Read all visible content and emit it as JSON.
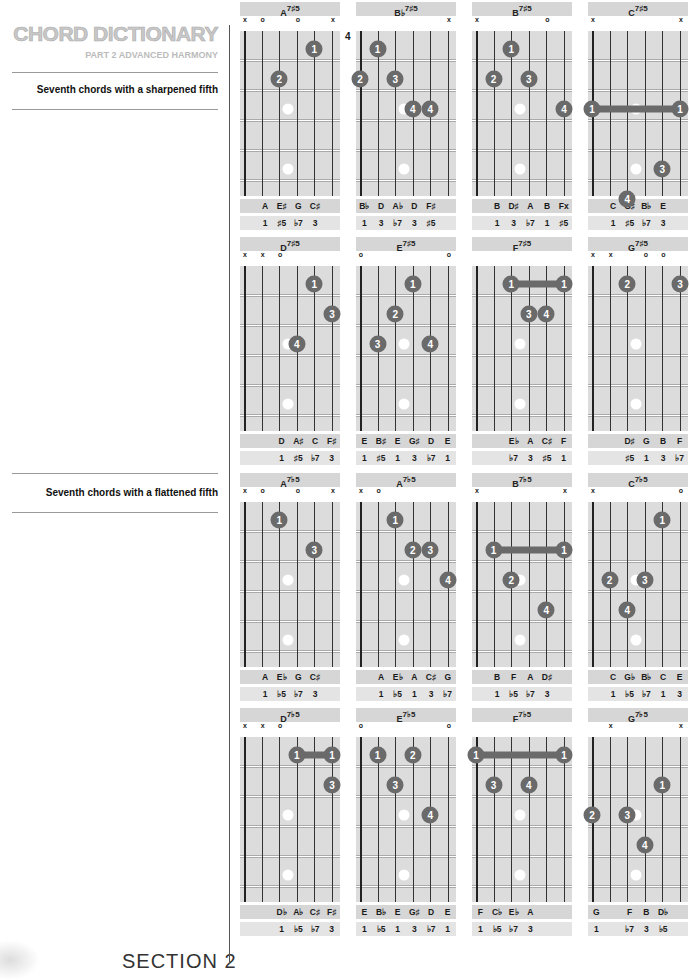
{
  "header": {
    "title": "CHORD DICTIONARY",
    "subtitle": "PART 2 ADVANCED HARMONY"
  },
  "sections": [
    {
      "label": "Seventh chords with a sharpened fifth"
    },
    {
      "label": "Seventh chords with a flattened fifth"
    }
  ],
  "footer": {
    "text": "SECTION 2"
  },
  "chords": [
    {
      "root": "A",
      "ext": "7♯5",
      "markers": [
        "x",
        "o",
        "",
        "o",
        "",
        "x"
      ],
      "fret": "",
      "fingers": [
        {
          "s": 5,
          "f": 1,
          "n": "1"
        },
        {
          "s": 3,
          "f": 2,
          "n": "2"
        }
      ],
      "barres": [],
      "notes": [
        "A",
        "E♯",
        "G",
        "C♯"
      ],
      "notes_offset": 1,
      "ints": [
        "1",
        "♯5",
        "♭7",
        "3"
      ],
      "ints_offset": 1
    },
    {
      "root": "B♭",
      "ext": "7♯5",
      "markers": [
        "",
        "",
        "",
        "",
        "",
        "x"
      ],
      "fret": "4",
      "fingers": [
        {
          "s": 2,
          "f": 1,
          "n": "1"
        },
        {
          "s": 1,
          "f": 2,
          "n": "2"
        },
        {
          "s": 3,
          "f": 2,
          "n": "3"
        },
        {
          "s": 4,
          "f": 3,
          "n": "4"
        },
        {
          "s": 5,
          "f": 3,
          "n": "4"
        }
      ],
      "barres": [],
      "notes": [
        "B♭",
        "D",
        "A♭",
        "D",
        "F♯"
      ],
      "notes_offset": 0,
      "ints": [
        "1",
        "3",
        "♭7",
        "3",
        "♯5"
      ],
      "ints_offset": 0
    },
    {
      "root": "B",
      "ext": "7♯5",
      "markers": [
        "x",
        "",
        "",
        "",
        "o",
        ""
      ],
      "fret": "",
      "fingers": [
        {
          "s": 3,
          "f": 1,
          "n": "1"
        },
        {
          "s": 2,
          "f": 2,
          "n": "2"
        },
        {
          "s": 4,
          "f": 2,
          "n": "3"
        },
        {
          "s": 6,
          "f": 3,
          "n": "4"
        }
      ],
      "barres": [],
      "notes": [
        "B",
        "D♯",
        "A",
        "B",
        "Fx"
      ],
      "notes_offset": 1,
      "ints": [
        "1",
        "3",
        "♭7",
        "1",
        "♯5"
      ],
      "ints_offset": 1
    },
    {
      "root": "C",
      "ext": "7♯5",
      "markers": [
        "x",
        "",
        "",
        "",
        "",
        "x"
      ],
      "fret": "",
      "fingers": [
        {
          "s": 1,
          "f": 3,
          "n": "1"
        },
        {
          "s": 6,
          "f": 3,
          "n": "1"
        },
        {
          "s": 5,
          "f": 5,
          "n": "3"
        },
        {
          "s": 3,
          "f": 6,
          "n": "4"
        }
      ],
      "barres": [
        {
          "from": 1,
          "to": 6,
          "f": 3
        }
      ],
      "notes": [
        "C",
        "G♯",
        "B♭",
        "E"
      ],
      "notes_offset": 1,
      "ints": [
        "1",
        "♯5",
        "♭7",
        "3"
      ],
      "ints_offset": 1
    },
    {
      "root": "D",
      "ext": "7♯5",
      "markers": [
        "x",
        "x",
        "o",
        "",
        "",
        ""
      ],
      "fret": "",
      "fingers": [
        {
          "s": 5,
          "f": 1,
          "n": "1"
        },
        {
          "s": 6,
          "f": 2,
          "n": "3"
        },
        {
          "s": 4,
          "f": 3,
          "n": "4"
        }
      ],
      "barres": [],
      "notes": [
        "D",
        "A♯",
        "C",
        "F♯"
      ],
      "notes_offset": 2,
      "ints": [
        "1",
        "♯5",
        "♭7",
        "3"
      ],
      "ints_offset": 2
    },
    {
      "root": "E",
      "ext": "7♯5",
      "markers": [
        "o",
        "",
        "",
        "",
        "",
        "o"
      ],
      "fret": "",
      "fingers": [
        {
          "s": 4,
          "f": 1,
          "n": "1"
        },
        {
          "s": 3,
          "f": 2,
          "n": "2"
        },
        {
          "s": 2,
          "f": 3,
          "n": "3"
        },
        {
          "s": 5,
          "f": 3,
          "n": "4"
        }
      ],
      "barres": [],
      "notes": [
        "E",
        "B♯",
        "E",
        "G♯",
        "D",
        "E"
      ],
      "notes_offset": 0,
      "ints": [
        "1",
        "♯5",
        "1",
        "3",
        "♭7",
        "1"
      ],
      "ints_offset": 0
    },
    {
      "root": "F",
      "ext": "7♯5",
      "markers": [
        "",
        "",
        "",
        "",
        "",
        ""
      ],
      "fret": "",
      "fingers": [
        {
          "s": 3,
          "f": 1,
          "n": "1"
        },
        {
          "s": 6,
          "f": 1,
          "n": "1"
        },
        {
          "s": 4,
          "f": 2,
          "n": "3"
        },
        {
          "s": 5,
          "f": 2,
          "n": "4"
        }
      ],
      "barres": [
        {
          "from": 3,
          "to": 6,
          "f": 1
        }
      ],
      "notes": [
        "E♭",
        "A",
        "C♯",
        "F"
      ],
      "notes_offset": 2,
      "ints": [
        "♭7",
        "3",
        "♯5",
        "1"
      ],
      "ints_offset": 2
    },
    {
      "root": "G",
      "ext": "7♯5",
      "markers": [
        "x",
        "x",
        "",
        "o",
        "o",
        ""
      ],
      "fret": "",
      "fingers": [
        {
          "s": 3,
          "f": 1,
          "n": "2"
        },
        {
          "s": 6,
          "f": 1,
          "n": "3"
        }
      ],
      "barres": [],
      "notes": [
        "D♯",
        "G",
        "B",
        "F"
      ],
      "notes_offset": 2,
      "ints": [
        "♯5",
        "1",
        "3",
        "♭7"
      ],
      "ints_offset": 2
    },
    {
      "root": "A",
      "ext": "7♭5",
      "markers": [
        "x",
        "o",
        "",
        "o",
        "",
        "x"
      ],
      "fret": "",
      "fingers": [
        {
          "s": 3,
          "f": 1,
          "n": "1"
        },
        {
          "s": 5,
          "f": 2,
          "n": "3"
        }
      ],
      "barres": [],
      "notes": [
        "A",
        "E♭",
        "G",
        "C♯"
      ],
      "notes_offset": 1,
      "ints": [
        "1",
        "♭5",
        "♭7",
        "3"
      ],
      "ints_offset": 1
    },
    {
      "root": "A",
      "ext": "7♭5",
      "markers": [
        "x",
        "o",
        "",
        "",
        "",
        ""
      ],
      "fret": "",
      "fingers": [
        {
          "s": 3,
          "f": 1,
          "n": "1"
        },
        {
          "s": 4,
          "f": 2,
          "n": "2"
        },
        {
          "s": 5,
          "f": 2,
          "n": "3"
        },
        {
          "s": 6,
          "f": 3,
          "n": "4"
        }
      ],
      "barres": [],
      "notes": [
        "A",
        "E♭",
        "A",
        "C♯",
        "G"
      ],
      "notes_offset": 1,
      "ints": [
        "1",
        "♭5",
        "1",
        "3",
        "♭7"
      ],
      "ints_offset": 1
    },
    {
      "root": "B",
      "ext": "7♭5",
      "markers": [
        "x",
        "",
        "",
        "",
        "",
        "x"
      ],
      "fret": "",
      "fingers": [
        {
          "s": 2,
          "f": 2,
          "n": "1"
        },
        {
          "s": 6,
          "f": 2,
          "n": "1"
        },
        {
          "s": 3,
          "f": 3,
          "n": "2"
        },
        {
          "s": 5,
          "f": 4,
          "n": "4"
        }
      ],
      "barres": [
        {
          "from": 2,
          "to": 6,
          "f": 2
        }
      ],
      "notes": [
        "B",
        "F",
        "A",
        "D♯"
      ],
      "notes_offset": 1,
      "ints": [
        "1",
        "♭5",
        "♭7",
        "3"
      ],
      "ints_offset": 1
    },
    {
      "root": "C",
      "ext": "7♭5",
      "markers": [
        "x",
        "",
        "",
        "",
        "",
        "o"
      ],
      "fret": "",
      "fingers": [
        {
          "s": 5,
          "f": 1,
          "n": "1"
        },
        {
          "s": 2,
          "f": 3,
          "n": "2"
        },
        {
          "s": 4,
          "f": 3,
          "n": "3"
        },
        {
          "s": 3,
          "f": 4,
          "n": "4"
        }
      ],
      "barres": [],
      "notes": [
        "C",
        "G♭",
        "B♭",
        "C",
        "E"
      ],
      "notes_offset": 1,
      "ints": [
        "1",
        "♭5",
        "♭7",
        "1",
        "3"
      ],
      "ints_offset": 1
    },
    {
      "root": "D",
      "ext": "7♭5",
      "markers": [
        "x",
        "x",
        "o",
        "",
        "",
        ""
      ],
      "fret": "",
      "fingers": [
        {
          "s": 4,
          "f": 1,
          "n": "1"
        },
        {
          "s": 6,
          "f": 1,
          "n": "1"
        },
        {
          "s": 6,
          "f": 2,
          "n": "3"
        }
      ],
      "barres": [
        {
          "from": 4,
          "to": 6,
          "f": 1
        }
      ],
      "notes": [
        "D♭",
        "A♭",
        "C♯",
        "F♯"
      ],
      "notes_offset": 2,
      "ints": [
        "1",
        "♭5",
        "♭7",
        "3"
      ],
      "ints_offset": 2
    },
    {
      "root": "E",
      "ext": "7♭5",
      "markers": [
        "o",
        "",
        "",
        "",
        "",
        "o"
      ],
      "fret": "",
      "fingers": [
        {
          "s": 2,
          "f": 1,
          "n": "1"
        },
        {
          "s": 4,
          "f": 1,
          "n": "2"
        },
        {
          "s": 3,
          "f": 2,
          "n": "3"
        },
        {
          "s": 5,
          "f": 3,
          "n": "4"
        }
      ],
      "barres": [],
      "notes": [
        "E",
        "B♭",
        "E",
        "G♯",
        "D",
        "E"
      ],
      "notes_offset": 0,
      "ints": [
        "1",
        "♭5",
        "1",
        "3",
        "♭7",
        "1"
      ],
      "ints_offset": 0
    },
    {
      "root": "F",
      "ext": "7♭5",
      "markers": [
        "",
        "",
        "",
        "",
        "",
        ""
      ],
      "fret": "",
      "fingers": [
        {
          "s": 1,
          "f": 1,
          "n": "1"
        },
        {
          "s": 6,
          "f": 1,
          "n": "1"
        },
        {
          "s": 2,
          "f": 2,
          "n": "3"
        },
        {
          "s": 4,
          "f": 2,
          "n": "4"
        }
      ],
      "barres": [
        {
          "from": 1,
          "to": 6,
          "f": 1
        }
      ],
      "notes": [
        "F",
        "C♭",
        "E♭",
        "A"
      ],
      "notes_offset": 0,
      "ints": [
        "1",
        "♭5",
        "♭7",
        "3"
      ],
      "ints_offset": 0
    },
    {
      "root": "G",
      "ext": "7♭5",
      "markers": [
        "",
        "x",
        "",
        "",
        "",
        "x"
      ],
      "fret": "",
      "fingers": [
        {
          "s": 5,
          "f": 2,
          "n": "1"
        },
        {
          "s": 1,
          "f": 3,
          "n": "2"
        },
        {
          "s": 3,
          "f": 3,
          "n": "3"
        },
        {
          "s": 4,
          "f": 4,
          "n": "4"
        }
      ],
      "barres": [],
      "notes": [
        "G",
        "",
        "F",
        "B",
        "D♭"
      ],
      "notes_offset": 0,
      "ints": [
        "1",
        "",
        "♭7",
        "3",
        "♭5"
      ],
      "ints_offset": 0
    }
  ]
}
